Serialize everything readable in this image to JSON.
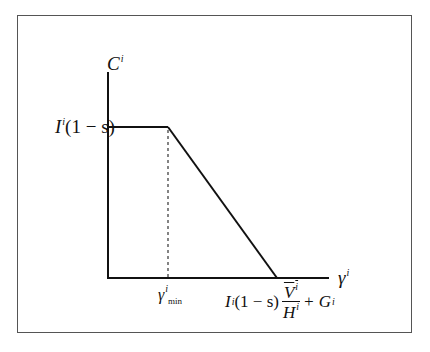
{
  "diagram": {
    "type": "piecewise-linear-function",
    "y_axis": {
      "label": "C",
      "superscript": "i"
    },
    "x_axis": {
      "label": "γ",
      "superscript": "i"
    },
    "y_tick": {
      "text": "I",
      "superscript": "i",
      "rest": "(1 − s)"
    },
    "x_tick_min": {
      "text": "γ",
      "superscript": "i",
      "subscript": "min"
    },
    "x_tick_end": {
      "prefix": "I",
      "prefix_sup": "i",
      "middle": "(1 − s)",
      "frac_num": "V",
      "frac_num_sup": "i",
      "frac_den": "H",
      "frac_den_sup": "i",
      "suffix": "+ G",
      "suffix_sup": "i"
    },
    "segments": [
      {
        "from": "(0, I^i(1-s))",
        "to": "(γ^i_min, I^i(1-s))",
        "style": "solid"
      },
      {
        "from": "(γ^i_min, I^i(1-s))",
        "to": "(I^i(1-s)V̄^i/H^i + G^i, 0)",
        "style": "solid"
      },
      {
        "from": "(γ^i_min, 0)",
        "to": "(γ^i_min, I^i(1-s))",
        "style": "dashed"
      }
    ]
  }
}
